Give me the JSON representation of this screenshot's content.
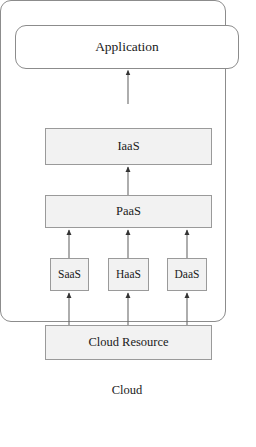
{
  "diagram": {
    "type": "layered-architecture",
    "title": "",
    "nodes": {
      "application": {
        "label": "Application",
        "shape": "rounded-rectangle",
        "fill": "#ffffff"
      },
      "cloud_container": {
        "label": "Cloud",
        "shape": "rounded-rectangle",
        "fill": "#ffffff"
      },
      "iaas": {
        "label": "IaaS",
        "shape": "rectangle",
        "fill": "#f2f2f2"
      },
      "paas": {
        "label": "PaaS",
        "shape": "rectangle",
        "fill": "#f2f2f2"
      },
      "saas": {
        "label": "SaaS",
        "shape": "rectangle",
        "fill": "#f2f2f2"
      },
      "haas": {
        "label": "HaaS",
        "shape": "rectangle",
        "fill": "#f2f2f2"
      },
      "daas": {
        "label": "DaaS",
        "shape": "rectangle",
        "fill": "#f2f2f2"
      },
      "cloud_resource": {
        "label": "Cloud Resource",
        "shape": "rectangle",
        "fill": "#f2f2f2"
      }
    },
    "edges": [
      {
        "from": "cloud_container",
        "to": "application",
        "direction": "up",
        "arrowhead": "solid-triangle"
      },
      {
        "from": "paas",
        "to": "iaas",
        "direction": "up",
        "arrowhead": "solid-triangle"
      },
      {
        "from": "saas",
        "to": "paas",
        "direction": "up",
        "arrowhead": "solid-triangle"
      },
      {
        "from": "haas",
        "to": "paas",
        "direction": "up",
        "arrowhead": "solid-triangle"
      },
      {
        "from": "daas",
        "to": "paas",
        "direction": "up",
        "arrowhead": "solid-triangle"
      },
      {
        "from": "cloud_resource",
        "to": "saas",
        "direction": "up",
        "arrowhead": "solid-triangle"
      },
      {
        "from": "cloud_resource",
        "to": "haas",
        "direction": "up",
        "arrowhead": "solid-triangle"
      },
      {
        "from": "cloud_resource",
        "to": "daas",
        "direction": "up",
        "arrowhead": "solid-triangle"
      }
    ],
    "colors": {
      "border": "#8c8c8c",
      "inner_border": "#9a9a9a",
      "box_fill": "#f2f2f2",
      "background": "#ffffff",
      "text": "#1a1a1a",
      "arrow": "#4d4d4d"
    }
  }
}
